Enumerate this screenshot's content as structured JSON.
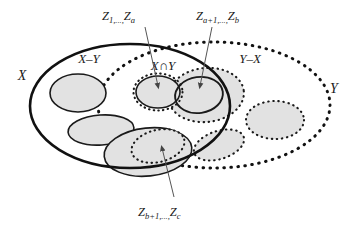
{
  "figure": {
    "type": "venn-diagram",
    "colors": {
      "stroke": "#111111",
      "blob_fill": "#e2e2e2",
      "blob_stroke": "#1a1a1a",
      "background": "#ffffff",
      "leader_line": "#555555"
    },
    "sets": {
      "x_label": "X",
      "y_label": "Y"
    },
    "regions": [
      {
        "id": "x-minus-y",
        "label": "X–Y"
      },
      {
        "id": "x-cap-y",
        "label": "X∩Y"
      },
      {
        "id": "y-minus-x",
        "label": "Y–X"
      }
    ],
    "callouts": [
      {
        "id": "z-1-a",
        "head": "Z",
        "head_sub": "1",
        "mid": ",...,",
        "tail": "Z",
        "tail_sub": "a",
        "target_region": "x-cap-y"
      },
      {
        "id": "z-a1-b",
        "head": "Z",
        "head_sub": "a+1",
        "mid": ",...,",
        "tail": "Z",
        "tail_sub": "b",
        "target_region": "y-minus-x"
      },
      {
        "id": "z-b1-c",
        "head": "Z",
        "head_sub": "b+1",
        "mid": ",...,",
        "tail": "Z",
        "tail_sub": "c",
        "target_region": "x-minus-y"
      }
    ]
  }
}
